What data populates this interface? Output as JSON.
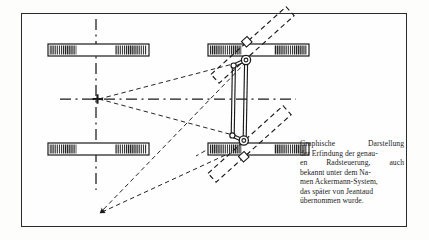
{
  "figure": {
    "title_semantic": "ackermann-steering-geometry-diagram",
    "background_color": "#fdfdfb",
    "frame_color": "#2a2a2a",
    "ink_color": "#1a1a1a",
    "centerline_style": "dash-dot",
    "construction_line_style": "dashed",
    "wheels": [
      {
        "name": "front-left-wheel",
        "position": "upper-left",
        "steered": false
      },
      {
        "name": "rear-left-wheel",
        "position": "lower-left",
        "steered": false
      },
      {
        "name": "front-right-wheel",
        "position": "upper-right",
        "steered": true
      },
      {
        "name": "rear-right-wheel",
        "position": "lower-right",
        "steered": true
      }
    ],
    "linkage": {
      "name": "steering-tie-rod-linkage",
      "pivots": 4,
      "type": "parallelogram-track-rod"
    },
    "markers": {
      "turn_center_cross": "turn-center-marker",
      "arrow_head": "construction-ray-arrowhead"
    }
  },
  "caption": {
    "lines": [
      "Graphische Darstellung",
      "der Erfindung der genau-",
      "en Radsteuerung, auch",
      "bekannt unter dem Na-",
      "men Ackermann-System,",
      "das später von Jeantaud",
      "übernommen wurde."
    ],
    "line_1_words": [
      "Graphische",
      "Darstellung"
    ],
    "line_3_words": [
      "en",
      "Radsteuerung,",
      "auch"
    ],
    "full_text": "Graphische Darstellung der Erfindung der genauen Radsteuerung, auch bekannt unter dem Namen Ackermann-System, das später von Jeantaud übernommen wurde."
  }
}
